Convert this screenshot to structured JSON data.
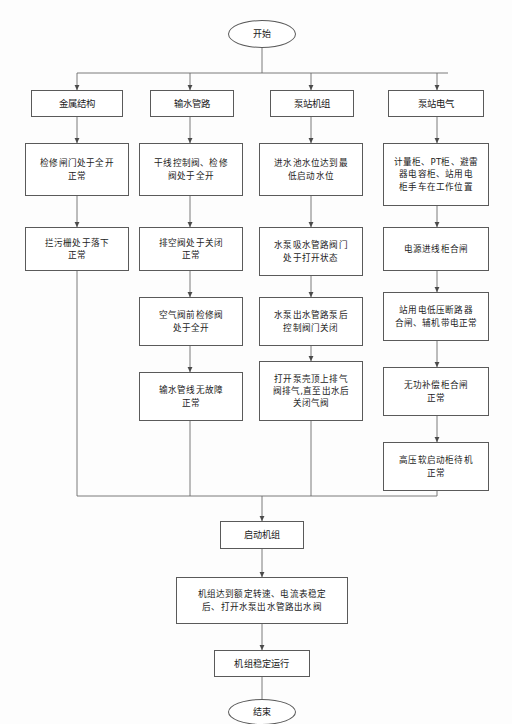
{
  "diagram": {
    "line_color": "#6b6b6b",
    "box_border_color": "#5a5a5a",
    "background": "#fdfdfd",
    "text_color": "#1b1b1b"
  },
  "start": {
    "label": "开始"
  },
  "end": {
    "label": "结束"
  },
  "branches": [
    {
      "key": "metal-structure",
      "header": "金属结构",
      "steps": [
        "检修闸门处于全开\n正常",
        "拦污栅处于落下\n正常"
      ]
    },
    {
      "key": "water-pipeline",
      "header": "输水管路",
      "steps": [
        "干线控制阀、检修\n阀处于全开",
        "排空阀处于关闭\n正常",
        "空气阀前检修阀\n处于全开",
        "输水管线无故障\n正常"
      ]
    },
    {
      "key": "pump-station-unit",
      "header": "泵站机组",
      "steps": [
        "进水池水位达到最\n低启动水位",
        "水泵吸水管路阀门\n处于打开状态",
        "水泵出水管路泵后\n控制阀门关闭",
        "打开泵壳顶上排气\n阀排气,直至出水后\n关闭气阀"
      ]
    },
    {
      "key": "pump-station-electrical",
      "header": "泵站电气",
      "steps": [
        "计量柜、PT柜、避雷\n器电容柜、站用电\n柜手车在工作位置",
        "电源进线柜合闸",
        "站用电低压断路器\n合闸、辅机带电正常",
        "无功补偿柜合闸\n正常",
        "高压软启动柜待机\n正常"
      ]
    }
  ],
  "tail": [
    "启动机组",
    "机组达到额定转速、电流表稳定\n后、打开水泵出水管路出水阀",
    "机组稳定运行"
  ]
}
